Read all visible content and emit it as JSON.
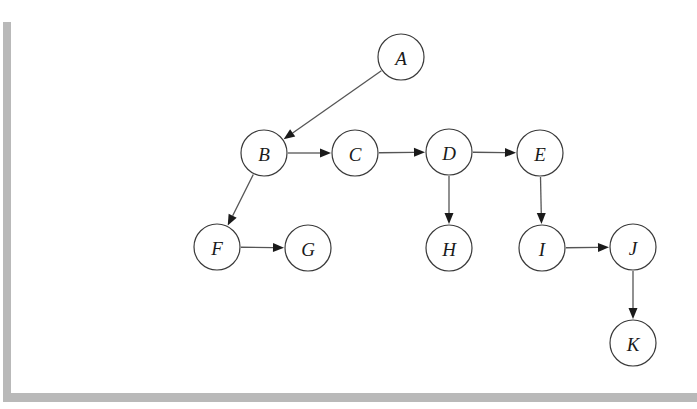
{
  "document": {
    "title": "Directed graph diagram",
    "background_color": "#ffffff",
    "shadow_color": "#b9b9b9",
    "node_stroke_color": "#3a3a3a",
    "node_fill_color": "#ffffff",
    "edge_color": "#555555",
    "arrowhead_color": "#1a1a1a",
    "label_color": "#1a1a1a"
  },
  "chart_data": {
    "type": "diagram",
    "title": "",
    "layout": "directed acyclic graph / tree",
    "node_radius": 23,
    "nodes": [
      {
        "id": "A",
        "label": "A",
        "x": 390,
        "y": 57
      },
      {
        "id": "B",
        "label": "B",
        "x": 253,
        "y": 153
      },
      {
        "id": "C",
        "label": "C",
        "x": 344,
        "y": 153
      },
      {
        "id": "D",
        "label": "D",
        "x": 438,
        "y": 152
      },
      {
        "id": "E",
        "label": "E",
        "x": 529,
        "y": 153
      },
      {
        "id": "F",
        "label": "F",
        "x": 206,
        "y": 247
      },
      {
        "id": "G",
        "label": "G",
        "x": 297,
        "y": 248
      },
      {
        "id": "H",
        "label": "H",
        "x": 438,
        "y": 248
      },
      {
        "id": "I",
        "label": "I",
        "x": 531,
        "y": 248
      },
      {
        "id": "J",
        "label": "J",
        "x": 622,
        "y": 247
      },
      {
        "id": "K",
        "label": "K",
        "x": 622,
        "y": 343
      }
    ],
    "edges": [
      {
        "from": "A",
        "to": "B",
        "direction": "diagonal-down-left"
      },
      {
        "from": "B",
        "to": "C",
        "direction": "right"
      },
      {
        "from": "C",
        "to": "D",
        "direction": "right"
      },
      {
        "from": "D",
        "to": "E",
        "direction": "right"
      },
      {
        "from": "B",
        "to": "F",
        "direction": "diagonal-down-left"
      },
      {
        "from": "F",
        "to": "G",
        "direction": "right"
      },
      {
        "from": "D",
        "to": "H",
        "direction": "down"
      },
      {
        "from": "E",
        "to": "I",
        "direction": "down"
      },
      {
        "from": "I",
        "to": "J",
        "direction": "right"
      },
      {
        "from": "J",
        "to": "K",
        "direction": "down"
      }
    ]
  }
}
